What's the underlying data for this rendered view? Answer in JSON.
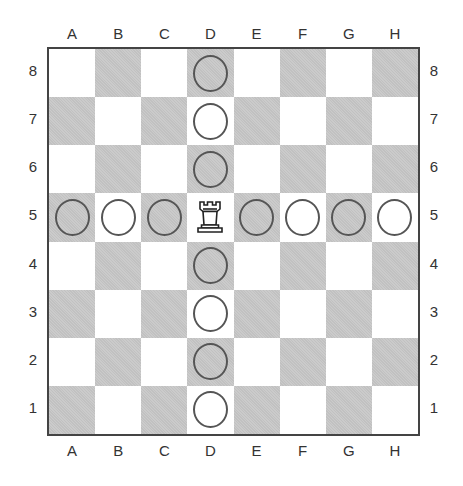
{
  "board": {
    "files": [
      "A",
      "B",
      "C",
      "D",
      "E",
      "F",
      "G",
      "H"
    ],
    "ranks": [
      "8",
      "7",
      "6",
      "5",
      "4",
      "3",
      "2",
      "1"
    ],
    "colors": {
      "dark_square": "#c9c9c9",
      "light_square": "#ffffff",
      "border": "#444444",
      "circle_stroke": "#555555"
    },
    "pieces": [
      {
        "square": "D5",
        "type": "rook",
        "color": "white",
        "icon": "rook-icon"
      }
    ],
    "markers": [
      {
        "square": "D8",
        "type": "circle"
      },
      {
        "square": "D7",
        "type": "circle"
      },
      {
        "square": "D6",
        "type": "circle"
      },
      {
        "square": "D4",
        "type": "circle"
      },
      {
        "square": "D3",
        "type": "circle"
      },
      {
        "square": "D2",
        "type": "circle"
      },
      {
        "square": "D1",
        "type": "circle"
      },
      {
        "square": "A5",
        "type": "circle"
      },
      {
        "square": "B5",
        "type": "circle"
      },
      {
        "square": "C5",
        "type": "circle"
      },
      {
        "square": "E5",
        "type": "circle"
      },
      {
        "square": "F5",
        "type": "circle"
      },
      {
        "square": "G5",
        "type": "circle"
      },
      {
        "square": "H5",
        "type": "circle"
      }
    ]
  }
}
